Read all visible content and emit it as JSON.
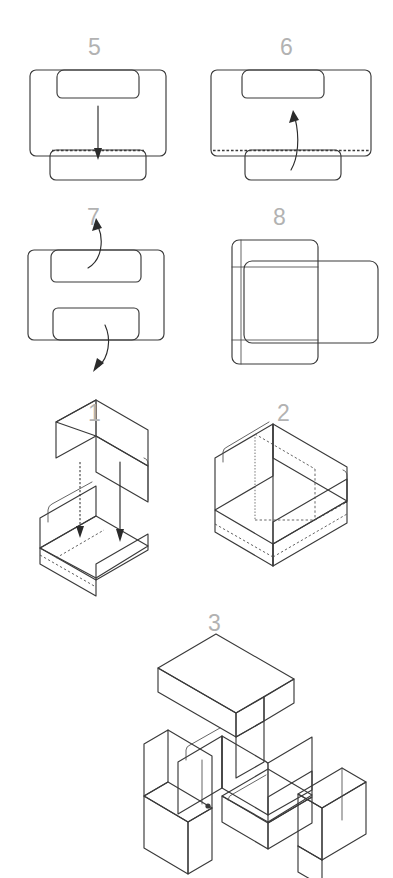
{
  "document": {
    "kind": "assembly-instruction-diagram",
    "subject": "folding box / carton assembly steps",
    "background_color": "#ffffff",
    "canvas": {
      "width": 393,
      "height": 878
    }
  },
  "palette": {
    "gray_mid": "#a8a8a8",
    "gray_light": "#c9c9c9",
    "gray_lighter": "#dcdcdc",
    "gray_pale": "#efefef",
    "white_panel": "#fbfbfb",
    "gray_dark": "#616161",
    "gray_darker": "#575757",
    "outline": "#3a3a3a",
    "number_color": "#b2b2b2"
  },
  "steps": [
    {
      "id": "step-5",
      "number": "5",
      "row": 1,
      "column": "left",
      "view": "flat-top-view",
      "annotation": "straight-down-arrow",
      "has_perforation": true
    },
    {
      "id": "step-6",
      "number": "6",
      "row": 1,
      "column": "right",
      "view": "flat-top-view",
      "annotation": "curved-up-arrow",
      "has_perforation": true
    },
    {
      "id": "step-7",
      "number": "7",
      "row": 2,
      "column": "left",
      "view": "flat-top-view",
      "annotation": "two-curved-arrows",
      "has_perforation": false
    },
    {
      "id": "step-8",
      "number": "8",
      "row": 2,
      "column": "right",
      "view": "flat-top-view",
      "annotation": "none",
      "has_perforation": false
    },
    {
      "id": "step-1",
      "number": "1",
      "row": 3,
      "column": "left",
      "view": "isometric-exploded",
      "annotation": "two-down-arrows",
      "has_perforation": false
    },
    {
      "id": "step-2",
      "number": "2",
      "row": 3,
      "column": "right",
      "view": "isometric-assembled",
      "annotation": "none",
      "has_perforation": false
    },
    {
      "id": "step-3",
      "number": "3",
      "row": 4,
      "column": "right",
      "view": "isometric-exploded-four-part",
      "annotation": "none",
      "has_perforation": false
    }
  ]
}
